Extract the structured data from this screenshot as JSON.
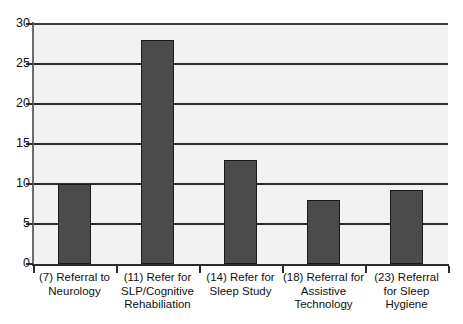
{
  "chart_data": {
    "type": "bar",
    "title": "",
    "subtitle": "",
    "xlabel": "",
    "ylabel": "",
    "categories": [
      "(7) Referral to Neurology",
      "(11) Refer for SLP/Cognitive Rehabiliation",
      "(14) Refer for Sleep Study",
      "(18) Referral for Assistive Technology",
      "(23) Referral for Sleep Hygiene"
    ],
    "category_lines": [
      [
        "(7) Referral to",
        "Neurology"
      ],
      [
        "(11) Refer for",
        "SLP/Cognitive",
        "Rehabiliation"
      ],
      [
        "(14) Refer for",
        "Sleep Study"
      ],
      [
        "(18) Referral for",
        "Assistive",
        "Technology"
      ],
      [
        "(23) Referral",
        "for Sleep",
        "Hygiene"
      ]
    ],
    "values": [
      10,
      28,
      13,
      8,
      9.3
    ],
    "ylim": [
      0,
      30
    ],
    "yticks": [
      0,
      5,
      10,
      15,
      20,
      25,
      30
    ],
    "ytick_labels": [
      "0",
      "5",
      "10",
      "15",
      "20",
      "25",
      "30"
    ],
    "grid": true,
    "legend": "none",
    "bar_color": "#4b4b4b",
    "bar_edge_color": "#1b1b1b",
    "plot_background": "#f2f2f2",
    "gridline_color": "#2b2b2b",
    "axis_color": "#2b2b2b"
  }
}
